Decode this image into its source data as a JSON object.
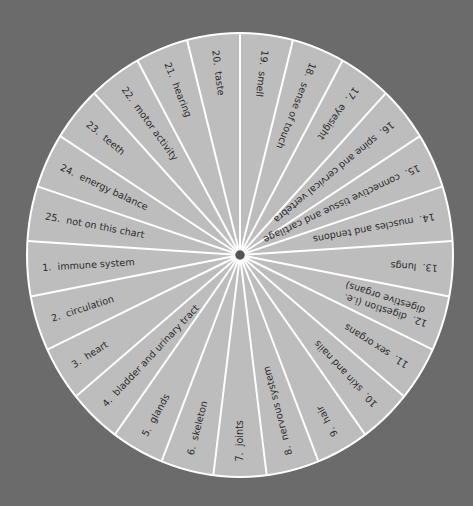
{
  "colors": {
    "background": "#6b6b6b",
    "segment_fill": "#bdbdbd",
    "divider": "#ffffff",
    "text": "#2b2b2b",
    "center_dot": "#555555"
  },
  "wheel": {
    "center": [
      240,
      255
    ],
    "radius_x": 213,
    "radius_y": 222,
    "segment_count": 25,
    "segments": [
      {
        "num": "1.",
        "label": "immune system"
      },
      {
        "num": "2.",
        "label": "circulation"
      },
      {
        "num": "3.",
        "label": "heart"
      },
      {
        "num": "4.",
        "label": "bladder and urinary tract"
      },
      {
        "num": "5.",
        "label": "glands"
      },
      {
        "num": "6.",
        "label": "skeleton"
      },
      {
        "num": "7.",
        "label": "joints"
      },
      {
        "num": "8.",
        "label": "nervous system"
      },
      {
        "num": "9.",
        "label": "hair"
      },
      {
        "num": "10.",
        "label": "skin and nails"
      },
      {
        "num": "11.",
        "label": "sex organs"
      },
      {
        "num": "12.",
        "label": "digestion (i.e.",
        "label2": "digestive organs)"
      },
      {
        "num": "13.",
        "label": "lungs"
      },
      {
        "num": "14.",
        "label": "muscles and tendons"
      },
      {
        "num": "15.",
        "label": "connective tissue and cartilage"
      },
      {
        "num": "16.",
        "label": "spine and cervical vertebra"
      },
      {
        "num": "17.",
        "label": "eyesight"
      },
      {
        "num": "18.",
        "label": "sense of touch"
      },
      {
        "num": "19.",
        "label": "smell"
      },
      {
        "num": "20.",
        "label": "taste"
      },
      {
        "num": "21.",
        "label": "hearing"
      },
      {
        "num": "22.",
        "label": "motor activity"
      },
      {
        "num": "23.",
        "label": "teeth"
      },
      {
        "num": "24.",
        "label": "energy balance"
      },
      {
        "num": "25.",
        "label": "not on this chart"
      }
    ]
  }
}
